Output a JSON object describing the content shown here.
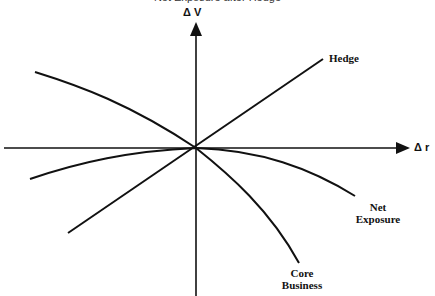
{
  "title_cut_off": "Net Exposure after Hedge",
  "axes": {
    "y_label": "Δ V",
    "x_label": "Δ r"
  },
  "curves": [
    {
      "name": "Hedge",
      "label": "Hedge",
      "shape": "straight line through origin, positive slope"
    },
    {
      "name": "Net Exposure",
      "label_line1": "Net",
      "label_line2": "Exposure",
      "shape": "concave curve, flat near origin, bending down to the right"
    },
    {
      "name": "Core Business",
      "label_line1": "Core",
      "label_line2": "Business",
      "shape": "concave curve, steeper downward to the right"
    }
  ],
  "colors": {
    "line": "#111111",
    "background": "#ffffff"
  }
}
